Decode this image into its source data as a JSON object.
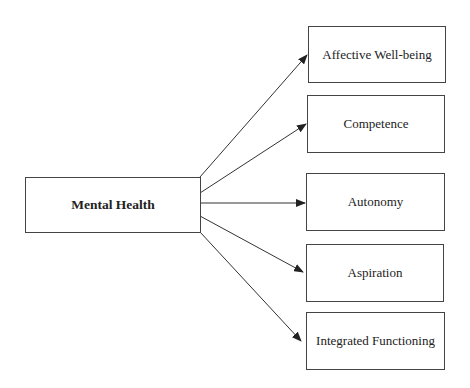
{
  "diagram": {
    "source": {
      "label": "Mental Health"
    },
    "targets": [
      {
        "label": "Affective Well-being"
      },
      {
        "label": "Competence"
      },
      {
        "label": "Autonomy"
      },
      {
        "label": "Aspiration"
      },
      {
        "label": "Integrated Functioning"
      }
    ],
    "edges": [
      {
        "from": "Mental Health",
        "to": "Affective Well-being"
      },
      {
        "from": "Mental Health",
        "to": "Competence"
      },
      {
        "from": "Mental Health",
        "to": "Autonomy"
      },
      {
        "from": "Mental Health",
        "to": "Aspiration"
      },
      {
        "from": "Mental Health",
        "to": "Integrated Functioning"
      }
    ],
    "colors": {
      "line": "#333333",
      "background": "#ffffff"
    }
  }
}
